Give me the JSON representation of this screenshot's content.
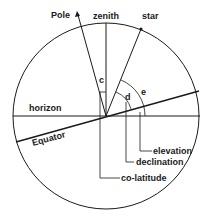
{
  "diagram": {
    "type": "celestial-sphere-geometry",
    "labels": {
      "pole": "Pole",
      "zenith": "zenith",
      "star": "star",
      "horizon": "horizon",
      "equator": "Equator",
      "angle_c": "c",
      "angle_d": "d",
      "angle_e": "e",
      "elevation": "elevation",
      "declination": "declination",
      "co_latitude": "co-latitude"
    },
    "colors": {
      "line": "#1a1a1a",
      "background": "#ffffff"
    }
  }
}
